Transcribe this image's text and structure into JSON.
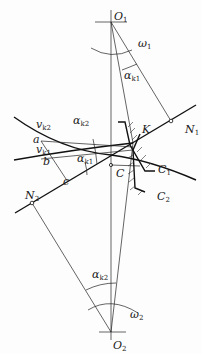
{
  "diagram": {
    "points": {
      "O1": {
        "label": "O",
        "sub": "1",
        "x": 111,
        "y": 22
      },
      "O2": {
        "label": "O",
        "sub": "2",
        "x": 111,
        "y": 332
      },
      "C": {
        "label": "C",
        "sub": "",
        "x": 111,
        "y": 165
      },
      "K": {
        "label": "K",
        "sub": "",
        "x": 133,
        "y": 143
      },
      "N1": {
        "label": "N",
        "sub": "1",
        "x": 171,
        "y": 121
      },
      "N2": {
        "label": "N",
        "sub": "2",
        "x": 32,
        "y": 203
      },
      "a": {
        "label": "a",
        "sub": "",
        "x": 41,
        "y": 141
      },
      "b": {
        "label": "b",
        "sub": "",
        "x": 49,
        "y": 163
      },
      "c": {
        "label": "c",
        "sub": "",
        "x": 68,
        "y": 178
      }
    },
    "labels": {
      "omega1": {
        "sym": "ω",
        "sub": "1"
      },
      "omega2": {
        "sym": "ω",
        "sub": "2"
      },
      "alpha_k1_top": {
        "sym": "α",
        "sub": "k1"
      },
      "alpha_k1_left": {
        "sym": "α",
        "sub": "k1"
      },
      "alpha_k2_top": {
        "sym": "α",
        "sub": "k2"
      },
      "alpha_k2_bottom": {
        "sym": "α",
        "sub": "k2"
      },
      "v_k1": {
        "sym": "v",
        "sub": "k1"
      },
      "v_k2": {
        "sym": "v",
        "sub": "k2"
      },
      "C1": {
        "sym": "C",
        "sub": "1"
      },
      "C2": {
        "sym": "C",
        "sub": "2"
      }
    },
    "colors": {
      "line": "#111111",
      "background": "#fdfdfd"
    }
  }
}
